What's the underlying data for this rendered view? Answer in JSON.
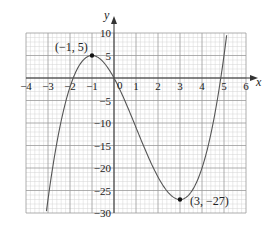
{
  "chart_data": {
    "type": "line",
    "title": "",
    "xlabel": "x",
    "ylabel": "y",
    "xlim": [
      -4,
      6
    ],
    "ylim": [
      -30,
      10
    ],
    "grid": true,
    "x_ticks": [
      -4,
      -3,
      -2,
      -1,
      0,
      1,
      2,
      3,
      4,
      5,
      6
    ],
    "y_ticks": [
      10,
      5,
      -5,
      -10,
      -15,
      -20,
      -25,
      -30
    ],
    "x_tick_labels": [
      "−4",
      "−3",
      "−2",
      "−1",
      "0",
      "1",
      "2",
      "3",
      "4",
      "5",
      "6"
    ],
    "y_tick_labels": [
      "10",
      "5",
      "−5",
      "−10",
      "−15",
      "−20",
      "−25",
      "−30"
    ],
    "origin_label": "0",
    "series": [
      {
        "name": "y = x³ − 3x² − 9x",
        "function": "x^3 - 3x^2 - 9x",
        "x_range": [
          -3.07,
          5.12
        ],
        "points": [
          [
            -3,
            -27
          ],
          [
            -2.5,
            -11.875
          ],
          [
            -2,
            -2
          ],
          [
            -1.5,
            3.375
          ],
          [
            -1,
            5
          ],
          [
            -0.5,
            3.625
          ],
          [
            0,
            0
          ],
          [
            0.5,
            -5.125
          ],
          [
            1,
            -11
          ],
          [
            1.5,
            -16.875
          ],
          [
            2,
            -22
          ],
          [
            2.5,
            -25.625
          ],
          [
            3,
            -27
          ],
          [
            3.5,
            -25.375
          ],
          [
            4,
            -20
          ],
          [
            4.5,
            -10.125
          ],
          [
            5,
            5
          ]
        ]
      }
    ],
    "annotations": [
      {
        "label": "(−1, 5)",
        "x": -1,
        "y": 5,
        "type": "turning-point-max"
      },
      {
        "label": "(3, −27)",
        "x": 3,
        "y": -27,
        "type": "turning-point-min"
      }
    ]
  },
  "labels": {
    "x_axis": "x",
    "y_axis": "y",
    "origin": "0",
    "max_point": "(−1, 5)",
    "min_point": "(3, −27)"
  },
  "colors": {
    "grid_minor": "#d4d4d4",
    "grid_major": "#9a9a9a",
    "axis": "#333333",
    "curve": "#555555",
    "point": "#111111"
  }
}
